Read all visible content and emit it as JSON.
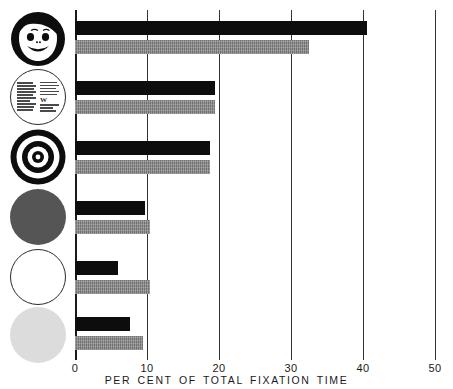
{
  "chart_data": {
    "type": "bar",
    "orientation": "horizontal",
    "title": "",
    "xlabel": "PER CENT OF TOTAL FIXATION TIME",
    "ylabel": "",
    "xlim": [
      0,
      50
    ],
    "xticks": [
      0,
      10,
      20,
      30,
      40,
      50
    ],
    "xtick_labels": [
      "0",
      "10",
      "20",
      "30",
      "40",
      "50"
    ],
    "grid": "vertical gridlines at each x tick",
    "legend": "none (two bars per stimulus: upper black, lower gray)",
    "categories": [
      "face",
      "printed-matter",
      "bulls-eye",
      "red-disc",
      "white-disc",
      "yellow-disc"
    ],
    "category_labels": [
      "Schematic face",
      "Printed matter",
      "Bull's-eye",
      "Red disc",
      "White disc",
      "Yellow disc"
    ],
    "series": [
      {
        "name": "upper-black-bar",
        "color": "#0d0d0d",
        "values": [
          40.5,
          19.5,
          18.7,
          9.7,
          6.0,
          7.6
        ]
      },
      {
        "name": "lower-gray-bar",
        "color": "#8c8c8c",
        "values": [
          32.5,
          19.5,
          18.7,
          10.4,
          10.4,
          9.4
        ]
      }
    ]
  },
  "axis": {
    "caption": "PER CENT OF TOTAL FIXATION TIME",
    "tick_labels": [
      "0",
      "10",
      "20",
      "30",
      "40",
      "50"
    ]
  },
  "stimuli": [
    {
      "key": "face",
      "name": "schematic-face-disc",
      "label": "Schematic face"
    },
    {
      "key": "print",
      "name": "printed-matter-disc",
      "label": "Printed matter"
    },
    {
      "key": "bulls",
      "name": "bulls-eye-disc",
      "label": "Bull's-eye"
    },
    {
      "key": "red",
      "name": "red-disc",
      "label": "Red disc",
      "color": "#555555"
    },
    {
      "key": "white",
      "name": "white-disc",
      "label": "White disc",
      "color": "#ffffff"
    },
    {
      "key": "yellow",
      "name": "yellow-disc",
      "label": "Yellow disc",
      "color": "#dcdcdc"
    }
  ],
  "colors": {
    "bar_black": "#0d0d0d",
    "bar_gray": "#8c8c8c",
    "axis": "#333333",
    "background": "#ffffff"
  }
}
